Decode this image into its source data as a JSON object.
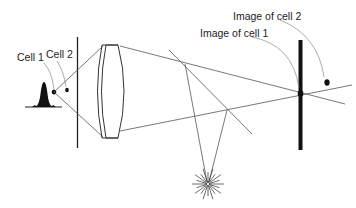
{
  "labels": {
    "cell1": "Cell 1",
    "cell2": "Cell 2",
    "image_cell1": "Image of cell 1",
    "image_cell2": "Image of cell 2"
  },
  "colors": {
    "line": "#555555",
    "ink": "#111111",
    "leader": "#888888"
  }
}
